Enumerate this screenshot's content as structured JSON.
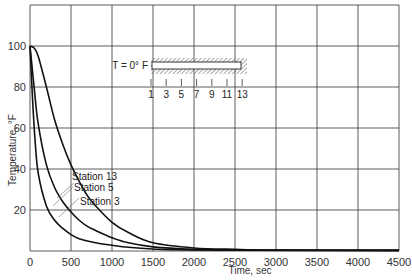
{
  "chart_data": {
    "type": "line",
    "title": "",
    "xlabel": "Time, sec",
    "ylabel": "Temperature, °F",
    "xlim": [
      0,
      4500
    ],
    "ylim": [
      0,
      120
    ],
    "grid": true,
    "x_ticks": [
      "0",
      "500",
      "1000",
      "1500",
      "2000",
      "2500",
      "3000",
      "3500",
      "4000",
      "4500"
    ],
    "y_ticks": [
      "20",
      "40",
      "60",
      "80",
      "100"
    ],
    "series": [
      {
        "name": "Station 13",
        "x": [
          0,
          50,
          100,
          200,
          300,
          400,
          500,
          600,
          700,
          800,
          1000,
          1200,
          1500,
          2000,
          2500,
          3000,
          4500
        ],
        "y": [
          100,
          99,
          95,
          80,
          64,
          52,
          42,
          34,
          27,
          22,
          14,
          9,
          4,
          1.5,
          0.8,
          0.5,
          0.3
        ]
      },
      {
        "name": "Station 5",
        "x": [
          0,
          50,
          100,
          200,
          300,
          400,
          500,
          600,
          700,
          800,
          1000,
          1200,
          1500,
          2000,
          2500,
          4500
        ],
        "y": [
          100,
          80,
          62,
          42,
          31,
          24,
          19,
          15,
          12,
          10,
          6.5,
          4,
          2,
          0.8,
          0.4,
          0.3
        ]
      },
      {
        "name": "Station 3",
        "x": [
          0,
          30,
          60,
          100,
          200,
          300,
          400,
          500,
          600,
          800,
          1000,
          1200,
          1500,
          2000,
          4500
        ],
        "y": [
          100,
          75,
          55,
          38,
          22,
          15,
          11,
          8,
          6,
          4,
          2.8,
          1.8,
          1,
          0.5,
          0.3
        ]
      }
    ],
    "annotations": [
      {
        "text": "Station 13",
        "x": 1000,
        "y": 66
      },
      {
        "text": "Station 5",
        "x": 1300,
        "y": 40
      },
      {
        "text": "Station 3",
        "x": 1300,
        "y": 28
      }
    ],
    "inset": {
      "label": "T = 0° F",
      "stations": [
        "1",
        "3",
        "5",
        "7",
        "9",
        "11",
        "13"
      ]
    }
  }
}
